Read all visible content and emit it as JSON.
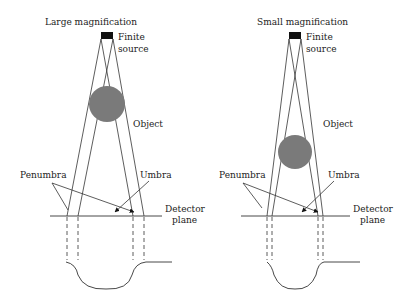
{
  "panels": [
    {
      "title": "Large magnification",
      "source_label_1": "Finite",
      "source_label_2": "source",
      "object_label": "Object",
      "penumbra_label": "Penumbra",
      "umbra_label": "Umbra",
      "detector_label_1": "Detector",
      "detector_label_2": "plane"
    },
    {
      "title": "Small magnification",
      "source_label_1": "Finite",
      "source_label_2": "source",
      "object_label": "Object",
      "penumbra_label": "Penumbra",
      "umbra_label": "Umbra",
      "detector_label_1": "Detector",
      "detector_label_2": "plane"
    }
  ],
  "colors": {
    "object": "#7a7a7a",
    "line": "#333333",
    "source": "#111111"
  }
}
